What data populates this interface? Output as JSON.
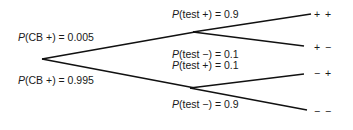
{
  "root": {
    "branches": [
      {
        "p": "P",
        "event": "(CB +) = 0.005"
      },
      {
        "p": "P",
        "event": "(CB +) = 0.995"
      }
    ]
  },
  "second_level": {
    "upper": [
      {
        "p": "P",
        "event": "(test +) = 0.9"
      },
      {
        "p": "P",
        "event": "(test −) = 0.1"
      }
    ],
    "lower": [
      {
        "p": "P",
        "event": "(test +) = 0.1"
      },
      {
        "p": "P",
        "event": "(test −) = 0.9"
      }
    ]
  },
  "outcomes": [
    "+ +",
    "+ −",
    "− +",
    "− −"
  ],
  "colors": {
    "line": "#111111",
    "text": "#1a1a1a"
  }
}
